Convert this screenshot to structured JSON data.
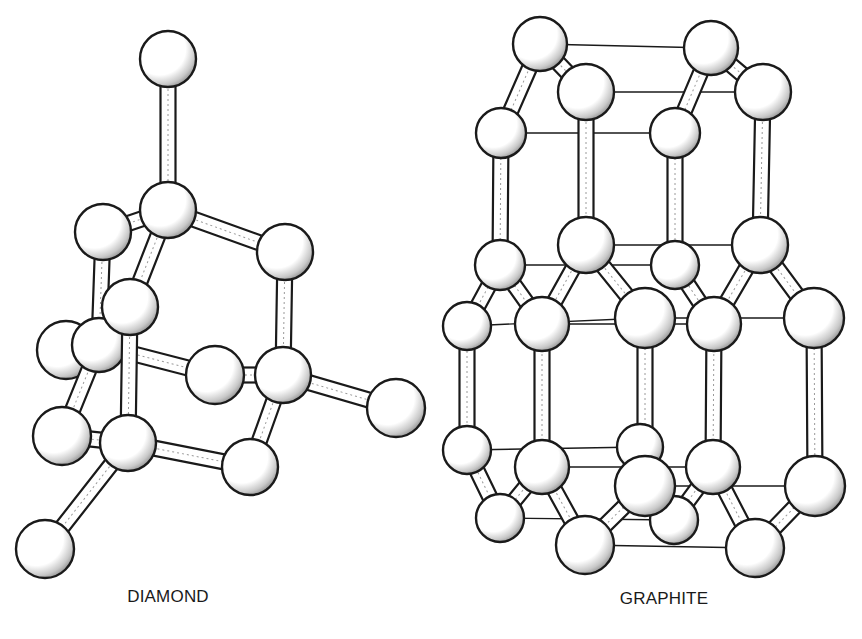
{
  "figure": {
    "background": "#ffffff",
    "ink": "#1a1a1a",
    "atom_fill": "#ffffff",
    "shade": "#555555"
  },
  "labels": {
    "diamond": {
      "text": "DIAMOND",
      "x": 168,
      "y": 597
    },
    "graphite": {
      "text": "GRAPHITE",
      "x": 664,
      "y": 599
    }
  },
  "diamond": {
    "atoms": [
      {
        "id": "top",
        "x": 168,
        "y": 59,
        "r": 28
      },
      {
        "id": "c1",
        "x": 168,
        "y": 210,
        "r": 28
      },
      {
        "id": "lu",
        "x": 103,
        "y": 232,
        "r": 28
      },
      {
        "id": "ru",
        "x": 285,
        "y": 252,
        "r": 28
      },
      {
        "id": "mf",
        "x": 130,
        "y": 307,
        "r": 28
      },
      {
        "id": "lb",
        "x": 99,
        "y": 345,
        "r": 27
      },
      {
        "id": "fl",
        "x": 66,
        "y": 350,
        "r": 29
      },
      {
        "id": "cr",
        "x": 215,
        "y": 375,
        "r": 29
      },
      {
        "id": "rc",
        "x": 283,
        "y": 375,
        "r": 28
      },
      {
        "id": "fr",
        "x": 396,
        "y": 408,
        "r": 29
      },
      {
        "id": "ll",
        "x": 62,
        "y": 436,
        "r": 29
      },
      {
        "id": "lc",
        "x": 128,
        "y": 443,
        "r": 28
      },
      {
        "id": "lr",
        "x": 250,
        "y": 467,
        "r": 28
      },
      {
        "id": "bl",
        "x": 45,
        "y": 549,
        "r": 29
      }
    ],
    "bonds": [
      [
        "top",
        "c1"
      ],
      [
        "c1",
        "lu"
      ],
      [
        "c1",
        "ru"
      ],
      [
        "c1",
        "mf"
      ],
      [
        "lu",
        "lb"
      ],
      [
        "ru",
        "rc"
      ],
      [
        "mf",
        "lc"
      ],
      [
        "lb",
        "cr"
      ],
      [
        "lb",
        "fl"
      ],
      [
        "lb",
        "ll"
      ],
      [
        "cr",
        "rc"
      ],
      [
        "rc",
        "fr"
      ],
      [
        "rc",
        "lr"
      ],
      [
        "ll",
        "lc"
      ],
      [
        "lc",
        "lr"
      ],
      [
        "lc",
        "bl"
      ]
    ],
    "draw_order": [
      "top",
      "lu",
      "c1",
      "ru",
      "fl",
      "lb",
      "cr",
      "rc",
      "fr",
      "ll",
      "lr",
      "mf",
      "lc",
      "bl"
    ]
  },
  "graphite": {
    "atoms": [
      {
        "id": "t1",
        "x": 540,
        "y": 44,
        "r": 27
      },
      {
        "id": "t2",
        "x": 586,
        "y": 92,
        "r": 28
      },
      {
        "id": "t3",
        "x": 501,
        "y": 133,
        "r": 25
      },
      {
        "id": "t4",
        "x": 711,
        "y": 48,
        "r": 27
      },
      {
        "id": "t5",
        "x": 763,
        "y": 92,
        "r": 28
      },
      {
        "id": "t6",
        "x": 675,
        "y": 133,
        "r": 25
      },
      {
        "id": "m1",
        "x": 500,
        "y": 265,
        "r": 25
      },
      {
        "id": "m2",
        "x": 586,
        "y": 245,
        "r": 28
      },
      {
        "id": "m3",
        "x": 675,
        "y": 265,
        "r": 24
      },
      {
        "id": "m4",
        "x": 760,
        "y": 245,
        "r": 28
      },
      {
        "id": "m5",
        "x": 467,
        "y": 326,
        "r": 24
      },
      {
        "id": "m6",
        "x": 542,
        "y": 324,
        "r": 27
      },
      {
        "id": "m7",
        "x": 645,
        "y": 318,
        "r": 30
      },
      {
        "id": "m8",
        "x": 714,
        "y": 324,
        "r": 27
      },
      {
        "id": "m9",
        "x": 814,
        "y": 318,
        "r": 30
      },
      {
        "id": "b1",
        "x": 467,
        "y": 450,
        "r": 24
      },
      {
        "id": "b2",
        "x": 542,
        "y": 467,
        "r": 27
      },
      {
        "id": "b3",
        "x": 640,
        "y": 447,
        "r": 23
      },
      {
        "id": "b4",
        "x": 713,
        "y": 467,
        "r": 27
      },
      {
        "id": "b5",
        "x": 500,
        "y": 518,
        "r": 24
      },
      {
        "id": "b6",
        "x": 645,
        "y": 486,
        "r": 30
      },
      {
        "id": "b7",
        "x": 674,
        "y": 520,
        "r": 24
      },
      {
        "id": "b8",
        "x": 815,
        "y": 486,
        "r": 30
      },
      {
        "id": "b9",
        "x": 585,
        "y": 545,
        "r": 29
      },
      {
        "id": "b10",
        "x": 755,
        "y": 548,
        "r": 29
      }
    ],
    "bonds": [
      [
        "t1",
        "t2"
      ],
      [
        "t1",
        "t3"
      ],
      [
        "t4",
        "t5"
      ],
      [
        "t4",
        "t6"
      ],
      [
        "t3",
        "m1"
      ],
      [
        "t2",
        "m2"
      ],
      [
        "t6",
        "m3"
      ],
      [
        "t5",
        "m4"
      ],
      [
        "m1",
        "m5"
      ],
      [
        "m1",
        "m6"
      ],
      [
        "m2",
        "m6"
      ],
      [
        "m2",
        "m7"
      ],
      [
        "m3",
        "m8"
      ],
      [
        "m4",
        "m8"
      ],
      [
        "m4",
        "m9"
      ],
      [
        "m5",
        "b1"
      ],
      [
        "m6",
        "b2"
      ],
      [
        "m7",
        "b6"
      ],
      [
        "m8",
        "b4"
      ],
      [
        "m9",
        "b8"
      ],
      [
        "b1",
        "b5"
      ],
      [
        "b2",
        "b5"
      ],
      [
        "b2",
        "b9"
      ],
      [
        "b6",
        "b9"
      ],
      [
        "b4",
        "b7"
      ],
      [
        "b4",
        "b10"
      ],
      [
        "b8",
        "b10"
      ]
    ],
    "thin_lines": [
      [
        "t1",
        "t4"
      ],
      [
        "t2",
        "t5"
      ],
      [
        "t3",
        "t6"
      ],
      [
        "m2",
        "m4"
      ],
      [
        "m1",
        "m3"
      ],
      [
        "m5",
        "m7"
      ],
      [
        "m6",
        "m8"
      ],
      [
        "m7",
        "m9"
      ],
      [
        "b1",
        "b3"
      ],
      [
        "b2",
        "b4"
      ],
      [
        "b6",
        "b8"
      ],
      [
        "b5",
        "b7"
      ],
      [
        "b9",
        "b10"
      ]
    ],
    "draw_order": [
      "t1",
      "t4",
      "t3",
      "t6",
      "t2",
      "t5",
      "m1",
      "m3",
      "m2",
      "m4",
      "m5",
      "m6",
      "m8",
      "m7",
      "m9",
      "b3",
      "b1",
      "b7",
      "b5",
      "b2",
      "b4",
      "b6",
      "b8",
      "b9",
      "b10"
    ]
  }
}
